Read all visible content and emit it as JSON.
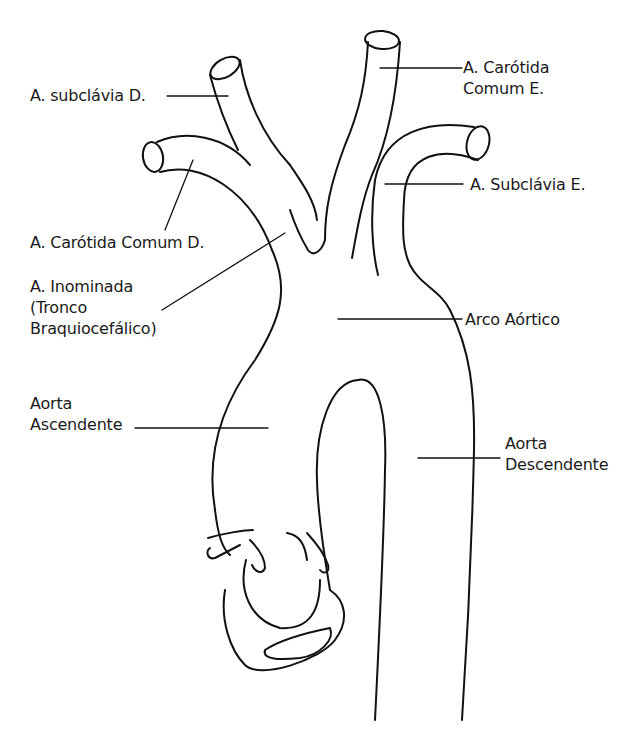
{
  "diagram": {
    "labels": {
      "subclavia_d": [
        "A. subclávia D."
      ],
      "carotida_e": [
        "A. Carótida",
        "Comum E."
      ],
      "subclavia_e": [
        "A. Subclávia E."
      ],
      "carotida_d": [
        "A. Carótida Comum D."
      ],
      "inominada": [
        "A. Inominada",
        "(Tronco",
        "Braquiocefálico)"
      ],
      "arco": [
        "Arco Aórtico"
      ],
      "aorta_asc": [
        "Aorta",
        "Ascendente"
      ],
      "aorta_desc": [
        "Aorta",
        "Descendente"
      ]
    },
    "stroke_color": "#111111",
    "background": "#ffffff"
  }
}
